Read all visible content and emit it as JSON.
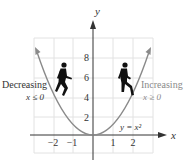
{
  "figure": {
    "function_label": "y = x²",
    "axis_x_label": "x",
    "axis_y_label": "y",
    "x_ticks": [
      {
        "value": -2,
        "label": "−2"
      },
      {
        "value": -1,
        "label": "−1"
      },
      {
        "value": 1,
        "label": "1"
      },
      {
        "value": 2,
        "label": "2"
      }
    ],
    "y_ticks": [
      {
        "value": 2,
        "label": "2"
      },
      {
        "value": 4,
        "label": "4"
      },
      {
        "value": 6,
        "label": "6"
      },
      {
        "value": 8,
        "label": "8"
      }
    ],
    "left_annotation": {
      "title": "Decreasing",
      "condition": "x ≤ 0"
    },
    "right_annotation": {
      "title": "Increasing",
      "condition": "x ≥ 0"
    },
    "left_figure_icon": "walking-down-person-icon",
    "right_figure_icon": "walking-up-person-icon",
    "colors": {
      "curve": "#8a8a8a",
      "grid": "#e2e2e2",
      "axis": "#333333",
      "text": "#333333",
      "right_annotation": "#8a8a8a",
      "silhouette": "#111111"
    }
  }
}
